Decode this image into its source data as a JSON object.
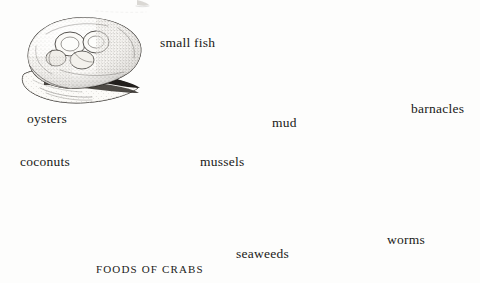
{
  "plate": {
    "title": "FOODS OF CRABS",
    "title_position": {
      "x": 96,
      "y": 264
    },
    "background_color": "#fdfdfc",
    "ink_color": "#24211e",
    "style": "stippled pen-and-ink natural history engraving",
    "top_cropped_mark": true
  },
  "items": [
    {
      "id": "oysters",
      "label": "oysters",
      "label_position": {
        "x": 27,
        "y": 112
      },
      "illustration_position": {
        "x": 4,
        "y": 16,
        "width": 140,
        "height": 92
      },
      "icon": "oyster-shell-illustration"
    },
    {
      "id": "small-fish",
      "label": "small fish",
      "label_position": {
        "x": 160,
        "y": 36
      },
      "illustration_position": {
        "x": 178,
        "y": 2,
        "width": 165,
        "height": 100
      },
      "icon": "small-fish-illustration"
    },
    {
      "id": "barnacles",
      "label": "barnacles",
      "label_position": {
        "x": 411,
        "y": 102
      },
      "illustration_position": {
        "x": 383,
        "y": 8,
        "width": 95,
        "height": 90
      },
      "icon": "barnacle-cluster-illustration"
    },
    {
      "id": "mud",
      "label": "mud",
      "label_position": {
        "x": 272,
        "y": 116
      },
      "illustration_position": {
        "x": 298,
        "y": 116,
        "width": 100,
        "height": 62
      },
      "icon": "mud-pebbles-illustration"
    },
    {
      "id": "mussels",
      "label": "mussels",
      "label_position": {
        "x": 200,
        "y": 155
      },
      "illustration_position": {
        "x": 104,
        "y": 112,
        "width": 100,
        "height": 62
      },
      "icon": "mussel-shell-illustration"
    },
    {
      "id": "coconuts",
      "label": "coconuts",
      "label_position": {
        "x": 20,
        "y": 155
      },
      "illustration_position": {
        "x": 6,
        "y": 178,
        "width": 120,
        "height": 76
      },
      "icon": "coconut-illustration"
    },
    {
      "id": "seaweeds",
      "label": "seaweeds",
      "label_position": {
        "x": 236,
        "y": 247
      },
      "illustration_position": {
        "x": 160,
        "y": 182,
        "width": 130,
        "height": 64
      },
      "icon": "seaweed-frond-illustration"
    },
    {
      "id": "worms",
      "label": "worms",
      "label_position": {
        "x": 387,
        "y": 233
      },
      "illustration_position": {
        "x": 300,
        "y": 180,
        "width": 168,
        "height": 72
      },
      "icon": "worm-coil-illustration"
    }
  ]
}
